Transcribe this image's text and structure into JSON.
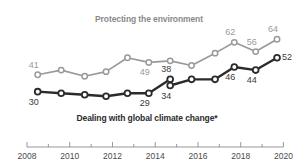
{
  "chart_data": {
    "type": "line",
    "title": "",
    "xlabel": "",
    "ylabel": "",
    "xlim": [
      2008,
      2020.4
    ],
    "ylim": [
      22,
      70
    ],
    "grid": false,
    "legend_position": "inline-annotation",
    "x": [
      2008.5,
      2009.6,
      2010.7,
      2011.7,
      2012.7,
      2013.7,
      2014.7,
      2014.7,
      2015.7,
      2016.8,
      2017.7,
      2018.7,
      2019.7
    ],
    "series": [
      {
        "name": "Protecting the environment",
        "color": "#9a9a9a",
        "label_color": "#9a9a9a",
        "points": [
          {
            "x": 2008.5,
            "y": 41,
            "label": "41",
            "label_pos": "above"
          },
          {
            "x": 2009.6,
            "y": 44,
            "label": "",
            "label_pos": ""
          },
          {
            "x": 2010.7,
            "y": 40,
            "label": "",
            "label_pos": ""
          },
          {
            "x": 2011.7,
            "y": 43,
            "label": "",
            "label_pos": ""
          },
          {
            "x": 2012.7,
            "y": 52,
            "label": "",
            "label_pos": ""
          },
          {
            "x": 2013.7,
            "y": 49,
            "label": "49",
            "label_pos": "below"
          },
          {
            "x": 2014.7,
            "y": 50,
            "label": "",
            "label_pos": ""
          },
          {
            "x": 2015.7,
            "y": 47,
            "label": "",
            "label_pos": ""
          },
          {
            "x": 2016.8,
            "y": 55,
            "label": "",
            "label_pos": ""
          },
          {
            "x": 2017.7,
            "y": 62,
            "label": "62",
            "label_pos": "above"
          },
          {
            "x": 2018.7,
            "y": 56,
            "label": "56",
            "label_pos": "above"
          },
          {
            "x": 2019.7,
            "y": 64,
            "label": "64",
            "label_pos": "above"
          }
        ]
      },
      {
        "name": "Dealing with global climate change*",
        "color": "#2b2b2b",
        "label_color": "#3a3a3a",
        "break_after_x": 2014.7,
        "points": [
          {
            "x": 2008.5,
            "y": 30,
            "label": "30",
            "label_pos": "below"
          },
          {
            "x": 2009.6,
            "y": 29,
            "label": "",
            "label_pos": ""
          },
          {
            "x": 2010.7,
            "y": 28,
            "label": "",
            "label_pos": ""
          },
          {
            "x": 2011.7,
            "y": 27,
            "label": "",
            "label_pos": ""
          },
          {
            "x": 2012.7,
            "y": 29,
            "label": "",
            "label_pos": ""
          },
          {
            "x": 2013.7,
            "y": 29,
            "label": "29",
            "label_pos": "below"
          },
          {
            "x": 2014.7,
            "y": 38,
            "label": "38",
            "label_pos": "above"
          },
          {
            "x": 2014.7,
            "y": 34,
            "label": "34",
            "label_pos": "below",
            "segment": 2
          },
          {
            "x": 2015.7,
            "y": 38,
            "label": "",
            "label_pos": "",
            "segment": 2
          },
          {
            "x": 2016.8,
            "y": 38,
            "label": "",
            "label_pos": "",
            "segment": 2
          },
          {
            "x": 2017.7,
            "y": 46,
            "label": "46",
            "label_pos": "below",
            "segment": 2
          },
          {
            "x": 2018.7,
            "y": 44,
            "label": "44",
            "label_pos": "below",
            "segment": 2
          },
          {
            "x": 2019.7,
            "y": 52,
            "label": "52",
            "label_pos": "right",
            "segment": 2
          }
        ]
      }
    ],
    "x_ticks": [
      {
        "value": 2008,
        "label": "2008",
        "major": true
      },
      {
        "value": 2009,
        "label": "",
        "major": false
      },
      {
        "value": 2010,
        "label": "2010",
        "major": true
      },
      {
        "value": 2011,
        "label": "",
        "major": false
      },
      {
        "value": 2012,
        "label": "2012",
        "major": true
      },
      {
        "value": 2013,
        "label": "",
        "major": false
      },
      {
        "value": 2014,
        "label": "2014",
        "major": true
      },
      {
        "value": 2015,
        "label": "",
        "major": false
      },
      {
        "value": 2016,
        "label": "2016",
        "major": true
      },
      {
        "value": 2017,
        "label": "",
        "major": false
      },
      {
        "value": 2018,
        "label": "2018",
        "major": true
      },
      {
        "value": 2019,
        "label": "",
        "major": false
      },
      {
        "value": 2020,
        "label": "2020",
        "major": true
      }
    ]
  },
  "annotations": {
    "environment_title": "Protecting the environment",
    "climate_title": "Dealing with global climate change*"
  },
  "axis": {
    "tick_labels": [
      "2008",
      "2010",
      "2012",
      "2014",
      "2016",
      "2018",
      "2020"
    ]
  }
}
